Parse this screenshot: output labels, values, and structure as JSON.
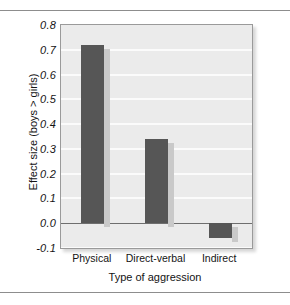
{
  "figure": {
    "background_color": "#ffffff",
    "plot_background_color": "#ebebeb",
    "gridline_color": "#fbfbfb",
    "bar_color": "#565656",
    "bar_shadow_color": "#c9c9c9",
    "frame_border_color": "#9a9a9a",
    "zero_line_color": "#6e6e6e"
  },
  "chart_data": {
    "type": "bar",
    "title": "",
    "subtitle": "",
    "xlabel": "Type of aggression",
    "ylabel": "Effect size (boys > girls)",
    "categories": [
      "Physical",
      "Direct-verbal",
      "Indirect"
    ],
    "values": [
      0.72,
      0.34,
      -0.06
    ],
    "series": [
      {
        "name": "Effect size (boys > girls)",
        "values": [
          0.72,
          0.34,
          -0.06
        ]
      }
    ],
    "ylim": [
      -0.1,
      0.8
    ],
    "ytick_labels": [
      "0.8",
      "0.7",
      "0.6",
      "0.5",
      "0.4",
      "0.3",
      "0.2",
      "0.1",
      "0.0",
      "-0.1"
    ],
    "ytick_values": [
      0.8,
      0.7,
      0.6,
      0.5,
      0.4,
      0.3,
      0.2,
      0.1,
      0.0,
      -0.1
    ],
    "ytick_step": 0.1,
    "grid": true,
    "grid_orientation": "horizontal",
    "legend": false,
    "legend_position": "none",
    "zero_line": true,
    "annotations": []
  },
  "axes": {
    "y_ticks": [
      {
        "label": "0.8",
        "value": 0.8
      },
      {
        "label": "0.7",
        "value": 0.7
      },
      {
        "label": "0.6",
        "value": 0.6
      },
      {
        "label": "0.5",
        "value": 0.5
      },
      {
        "label": "0.4",
        "value": 0.4
      },
      {
        "label": "0.3",
        "value": 0.3
      },
      {
        "label": "0.2",
        "value": 0.2
      },
      {
        "label": "0.1",
        "value": 0.1
      },
      {
        "label": "0.0",
        "value": 0.0
      },
      {
        "label": "-0.1",
        "value": -0.1
      }
    ],
    "x_ticks": [
      {
        "label": "Physical"
      },
      {
        "label": "Direct-verbal"
      },
      {
        "label": "Indirect"
      }
    ],
    "x_title": "Type of aggression",
    "y_title": "Effect size (boys > girls)"
  }
}
